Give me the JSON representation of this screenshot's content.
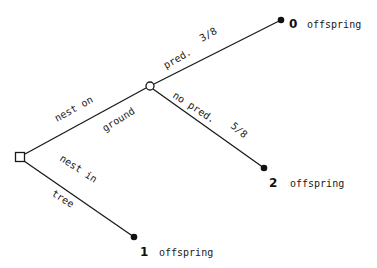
{
  "diagram": {
    "type": "decision-tree",
    "colors": {
      "line": "#1a1a1a",
      "background": "#ffffff",
      "outcome_dot": "#111111"
    },
    "nodes": {
      "decision": {
        "shape": "square",
        "x": 20,
        "y": 157
      },
      "chance": {
        "shape": "circle",
        "x": 150,
        "y": 86
      },
      "outcome_predation": {
        "shape": "filled-dot",
        "x": 281,
        "y": 20,
        "value": "0",
        "label": "offspring"
      },
      "outcome_no_predation": {
        "shape": "filled-dot",
        "x": 264,
        "y": 168,
        "value": "2",
        "label": "offspring"
      },
      "outcome_tree": {
        "shape": "filled-dot",
        "x": 134,
        "y": 237,
        "value": "1",
        "label": "offspring"
      }
    },
    "branches": {
      "ground": {
        "label_top": "nest on",
        "label_bottom": "ground"
      },
      "tree": {
        "label_top": "nest in",
        "label_bottom": "tree"
      },
      "pred": {
        "label": "pred.",
        "probability": "3/8"
      },
      "no_pred": {
        "label": "no pred.",
        "probability": "5/8"
      }
    }
  }
}
